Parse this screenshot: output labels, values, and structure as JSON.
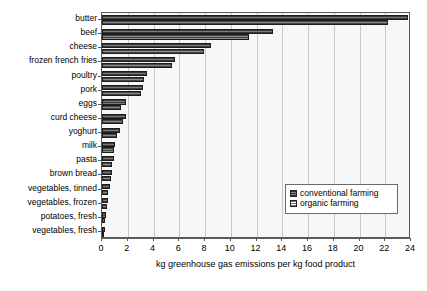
{
  "chart_data": {
    "type": "bar",
    "orientation": "horizontal",
    "title": "",
    "xlabel": "kg greenhouse gas emissions per kg food product",
    "ylabel": "",
    "xlim": [
      0,
      24
    ],
    "xticks": [
      0,
      2,
      4,
      6,
      8,
      10,
      12,
      14,
      16,
      18,
      20,
      22,
      24
    ],
    "grid": true,
    "legend_position": "inside-lower-right",
    "categories": [
      "butter",
      "beef",
      "cheese",
      "frozen french fries",
      "poultry",
      "pork",
      "eggs",
      "curd cheese",
      "yoghurt",
      "milk",
      "pasta",
      "brown bread",
      "vegetables, tinned",
      "vegetables, frozen",
      "potatoes, fresh",
      "vegetables, fresh"
    ],
    "series": [
      {
        "name": "conventional farming",
        "color": "#5b5b5b",
        "values": [
          23.8,
          13.3,
          8.5,
          5.7,
          3.5,
          3.2,
          1.9,
          1.9,
          1.4,
          1.0,
          0.9,
          0.8,
          0.6,
          0.5,
          0.3,
          0.2
        ]
      },
      {
        "name": "organic farming",
        "color": "#6a6a6a",
        "values": [
          22.2,
          11.4,
          7.9,
          5.4,
          3.3,
          3.0,
          1.5,
          1.6,
          1.2,
          0.9,
          0.8,
          0.7,
          0.5,
          0.4,
          0.2,
          0.15
        ]
      }
    ]
  },
  "legend": {
    "items": [
      {
        "label": "conventional farming",
        "swatch": "conventional"
      },
      {
        "label": "organic farming",
        "swatch": "organic"
      }
    ]
  }
}
